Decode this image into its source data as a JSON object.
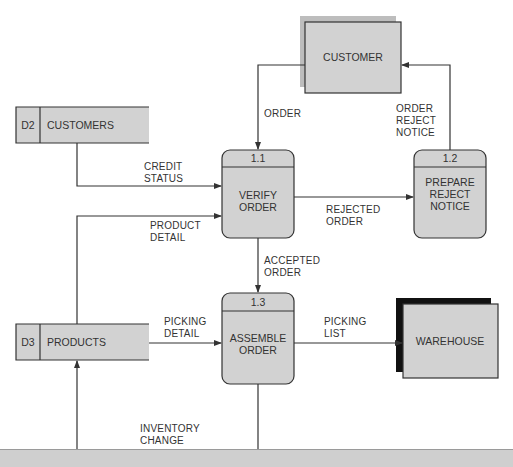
{
  "colors": {
    "box_fill": "#d2d2d2",
    "shadow_gray": "#bdbdbd",
    "shadow_black": "#111111",
    "line": "#333333",
    "bottom_band": "#cfcfcf"
  },
  "external_entities": [
    {
      "id": "customer",
      "label": "CUSTOMER",
      "shadow": "gray"
    },
    {
      "id": "warehouse",
      "label": "WAREHOUSE",
      "shadow": "black"
    }
  ],
  "data_stores": [
    {
      "id": "D2",
      "label": "CUSTOMERS"
    },
    {
      "id": "D3",
      "label": "PRODUCTS"
    }
  ],
  "processes": [
    {
      "number": "1.1",
      "label_line1": "VERIFY",
      "label_line2": "ORDER"
    },
    {
      "number": "1.2",
      "label_line1": "PREPARE",
      "label_line2": "REJECT",
      "label_line3": "NOTICE"
    },
    {
      "number": "1.3",
      "label_line1": "ASSEMBLE",
      "label_line2": "ORDER"
    }
  ],
  "flows": {
    "order": "ORDER",
    "order_reject_notice": "ORDER\nREJECT\nNOTICE",
    "credit_status": "CREDIT\nSTATUS",
    "product_detail": "PRODUCT\nDETAIL",
    "rejected_order": "REJECTED\nORDER",
    "accepted_order": "ACCEPTED\nORDER",
    "picking_detail": "PICKING\nDETAIL",
    "picking_list": "PICKING\nLIST",
    "inventory_change": "INVENTORY\nCHANGE"
  }
}
